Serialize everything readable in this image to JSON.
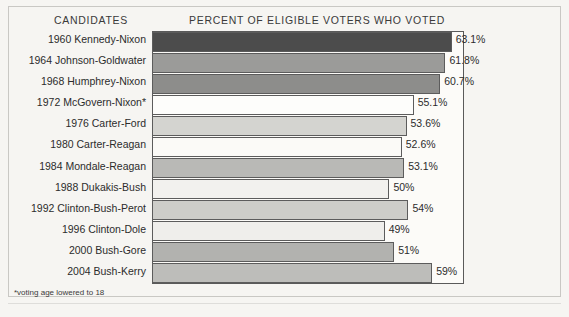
{
  "header": {
    "candidates_label": "CANDIDATES",
    "percent_label": "PERCENT OF ELIGIBLE VOTERS WHO VOTED"
  },
  "footnote": "*voting age lowered to 18",
  "chart_data": {
    "type": "bar",
    "orientation": "horizontal",
    "title": "PERCENT OF ELIGIBLE VOTERS WHO VOTED",
    "xlabel": "PERCENT OF ELIGIBLE VOTERS WHO VOTED",
    "ylabel": "CANDIDATES",
    "xlim": [
      0,
      65.7
    ],
    "grid": false,
    "legend": false,
    "annotations": [
      "*voting age lowered to 18"
    ],
    "categories": [
      "1960 Kennedy-Nixon",
      "1964 Johnson-Goldwater",
      "1968 Humphrey-Nixon",
      "1972 McGovern-Nixon*",
      "1976 Carter-Ford",
      "1980 Carter-Reagan",
      "1984 Mondale-Reagan",
      "1988 Dukakis-Bush",
      "1992 Clinton-Bush-Perot",
      "1996 Clinton-Dole",
      "2000 Bush-Gore",
      "2004 Bush-Kerry"
    ],
    "values": [
      63.1,
      61.8,
      60.7,
      55.1,
      53.6,
      52.6,
      53.1,
      50,
      54,
      49,
      51,
      59
    ],
    "value_labels": [
      "63.1%",
      "61.8%",
      "60.7%",
      "55.1%",
      "53.6%",
      "52.6%",
      "53.1%",
      "50%",
      "54%",
      "49%",
      "51%",
      "59%"
    ],
    "bar_colors": [
      "#4c4c4c",
      "#9b9b99",
      "#8d8d8b",
      "#fdfdfb",
      "#d4d4d0",
      "#fbfaf7",
      "#b9b9b6",
      "#f2f1ee",
      "#cdcdc9",
      "#efeeeb",
      "#b2b2af",
      "#bdbdba"
    ]
  },
  "rows": [
    {
      "label": "1960 Kennedy-Nixon",
      "value": 63.1,
      "value_label": "63.1%",
      "color": "#4c4c4c"
    },
    {
      "label": "1964 Johnson-Goldwater",
      "value": 61.8,
      "value_label": "61.8%",
      "color": "#9b9b99"
    },
    {
      "label": "1968 Humphrey-Nixon",
      "value": 60.7,
      "value_label": "60.7%",
      "color": "#8d8d8b"
    },
    {
      "label": "1972 McGovern-Nixon*",
      "value": 55.1,
      "value_label": "55.1%",
      "color": "#fdfdfb"
    },
    {
      "label": "1976 Carter-Ford",
      "value": 53.6,
      "value_label": "53.6%",
      "color": "#d4d4d0"
    },
    {
      "label": "1980 Carter-Reagan",
      "value": 52.6,
      "value_label": "52.6%",
      "color": "#fbfaf7"
    },
    {
      "label": "1984 Mondale-Reagan",
      "value": 53.1,
      "value_label": "53.1%",
      "color": "#b9b9b6"
    },
    {
      "label": "1988 Dukakis-Bush",
      "value": 50,
      "value_label": "50%",
      "color": "#f2f1ee"
    },
    {
      "label": "1992 Clinton-Bush-Perot",
      "value": 54,
      "value_label": "54%",
      "color": "#cdcdc9"
    },
    {
      "label": "1996 Clinton-Dole",
      "value": 49,
      "value_label": "49%",
      "color": "#efeeeb"
    },
    {
      "label": "2000 Bush-Gore",
      "value": 51,
      "value_label": "51%",
      "color": "#b2b2af"
    },
    {
      "label": "2004 Bush-Kerry",
      "value": 59,
      "value_label": "59%",
      "color": "#bdbdba"
    }
  ]
}
